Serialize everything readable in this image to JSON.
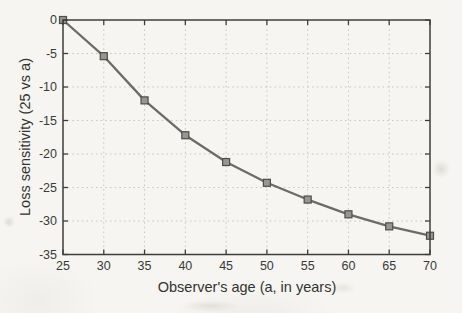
{
  "chart_data": {
    "type": "line",
    "title": "",
    "xlabel": "Observer's age (a, in years)",
    "ylabel": "Loss sensitivity (25 vs a)",
    "x": [
      25,
      30,
      35,
      40,
      45,
      50,
      55,
      60,
      65,
      70
    ],
    "y": [
      0,
      -5.4,
      -12.0,
      -17.2,
      -21.2,
      -24.3,
      -26.8,
      -29.0,
      -30.8,
      -32.2
    ],
    "series_name": "loss-sensitivity-vs-age",
    "xlim": [
      25,
      70
    ],
    "ylim": [
      -35,
      0
    ],
    "xticks": [
      25,
      30,
      35,
      40,
      45,
      50,
      55,
      60,
      65,
      70
    ],
    "yticks": [
      0,
      -5,
      -10,
      -15,
      -20,
      -25,
      -30,
      -35
    ],
    "grid": "dotted",
    "legend": "none",
    "marker": "square",
    "colors": {
      "line": "#6b6b68",
      "marker_fill": "#97968f",
      "marker_edge": "#4d4d4a",
      "grid": "#c7c6bf",
      "axis": "#3e3e3b",
      "text": "#3a3a38",
      "paper": "#f6f5f1"
    }
  }
}
